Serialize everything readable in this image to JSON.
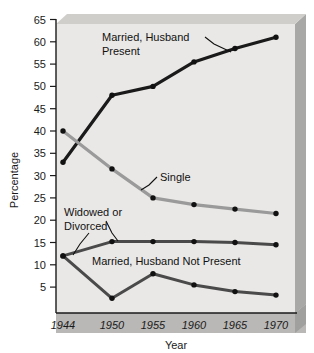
{
  "chart_data": {
    "type": "line",
    "title": "",
    "xlabel": "Year",
    "ylabel": "Percentage",
    "categories": [
      "1944",
      "1950",
      "1955",
      "1960",
      "1965",
      "1970"
    ],
    "x": [
      1944,
      1950,
      1955,
      1960,
      1965,
      1970
    ],
    "xlim": [
      1942,
      1972
    ],
    "ylim": [
      0,
      66
    ],
    "yticks": [
      5,
      10,
      15,
      20,
      25,
      30,
      35,
      40,
      45,
      50,
      55,
      60,
      65
    ],
    "ytick_labels": [
      "5",
      "10",
      "15",
      "20",
      "25",
      "30",
      "35",
      "40",
      "45",
      "50",
      "55",
      "60",
      "65"
    ],
    "xtick_labels": [
      "1944",
      "1950",
      "1955",
      "1960",
      "1965",
      "1970"
    ],
    "grid": false,
    "legend": "annotations-on-plot",
    "series": [
      {
        "name": "Married, Husband Present",
        "color": "#1a1a1a",
        "values": [
          33,
          48,
          50,
          55.5,
          58.5,
          61
        ]
      },
      {
        "name": "Single",
        "color": "#9a9a9a",
        "values": [
          40,
          31.5,
          25,
          23.5,
          22.5,
          21.5
        ]
      },
      {
        "name": "Widowed or Divorced",
        "color": "#4a4a4a",
        "values": [
          12,
          15.2,
          15.2,
          15.2,
          15,
          14.5
        ]
      },
      {
        "name": "Married, Husband Not Present",
        "color": "#4a4a4a",
        "values": [
          12,
          2.5,
          8,
          5.5,
          4,
          3.2
        ]
      }
    ],
    "annotations": [
      {
        "text": "Married, Husband",
        "sub": "Present"
      },
      {
        "text": "Single"
      },
      {
        "text": "Widowed or",
        "sub": "Divorced"
      },
      {
        "text": "Married, Husband Not Present"
      }
    ]
  },
  "axes": {
    "y_title": "Percentage",
    "x_title": "Year",
    "y_ticks": [
      "65",
      "60",
      "55",
      "50",
      "45",
      "40",
      "35",
      "30",
      "25",
      "20",
      "15",
      "10",
      "5"
    ],
    "x_ticks": [
      "1944",
      "1950",
      "1955",
      "1960",
      "1965",
      "1970"
    ]
  },
  "labels": {
    "married_husband_present_l1": "Married, Husband",
    "married_husband_present_l2": "Present",
    "single": "Single",
    "widowed_divorced_l1": "Widowed or",
    "widowed_divorced_l2": "Divorced",
    "married_husband_not_present": "Married, Husband Not Present"
  },
  "colors": {
    "panel": "#e9e8e6",
    "shadow": "#a8a8a6",
    "axis": "#1a1a1a",
    "married_present": "#1a1a1a",
    "single": "#9a9a9a",
    "widowed": "#4a4a4a",
    "married_not_present": "#4a4a4a"
  }
}
